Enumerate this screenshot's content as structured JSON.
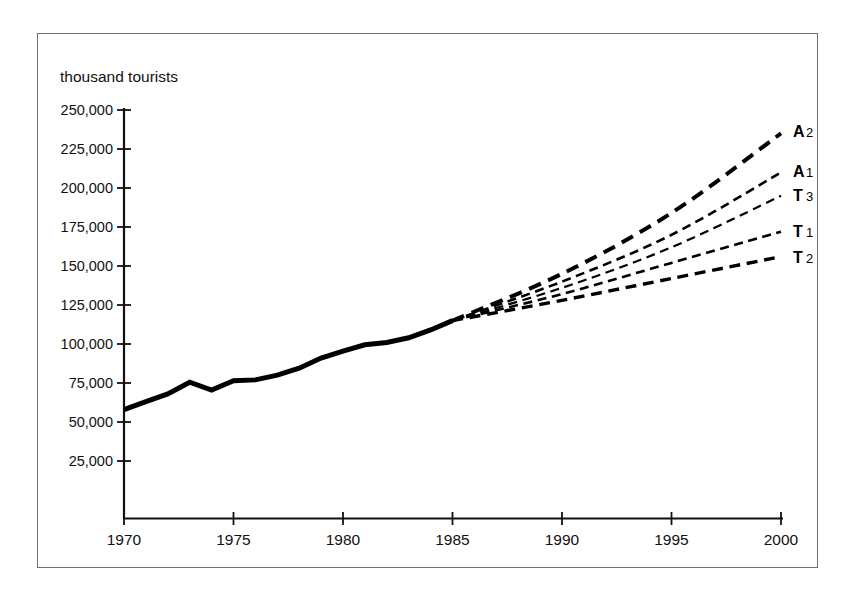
{
  "figure": {
    "axis_title": "thousand tourists",
    "border_color": "#6f6f6f"
  },
  "chart_data": {
    "type": "line",
    "title": "",
    "subtitle": "",
    "xlabel": "",
    "ylabel": "thousand tourists",
    "xlim": [
      1970,
      2000
    ],
    "ylim": [
      0,
      250000
    ],
    "xticks": [
      1970,
      1975,
      1980,
      1985,
      1990,
      1995,
      2000
    ],
    "xtick_labels": [
      "1970",
      "1975",
      "1980",
      "1985",
      "1990",
      "1995",
      "2000"
    ],
    "yticks": [
      25000,
      50000,
      75000,
      100000,
      125000,
      150000,
      175000,
      200000,
      225000,
      250000
    ],
    "ytick_labels": [
      "25,000",
      "50,000",
      "75,000",
      "100,000",
      "125,000",
      "150,000",
      "175,000",
      "200,000",
      "225,000",
      "250,000"
    ],
    "grid": false,
    "legend_position": "right-inline-end-labels",
    "branch_year": 1985,
    "branch_value": 115000,
    "series": [
      {
        "name": "Historical",
        "label": "",
        "style": "solid",
        "linewidth": 5,
        "color": "#000000",
        "x": [
          1970,
          1971,
          1972,
          1973,
          1974,
          1975,
          1976,
          1977,
          1978,
          1979,
          1980,
          1981,
          1982,
          1983,
          1984,
          1985
        ],
        "values": [
          58000,
          63000,
          68000,
          75500,
          70500,
          76500,
          77000,
          80000,
          84500,
          91000,
          95500,
          99500,
          101000,
          104000,
          109000,
          115000
        ]
      },
      {
        "name": "A2",
        "label": "A2",
        "label_letter": "A",
        "label_digit": "2",
        "style": "dashed",
        "linewidth": 4,
        "color": "#000000",
        "x": [
          1985,
          1990,
          1995,
          2000
        ],
        "values": [
          115000,
          145000,
          184000,
          235000
        ]
      },
      {
        "name": "A1",
        "label": "A1",
        "label_letter": "A",
        "label_digit": "1",
        "style": "dashed",
        "linewidth": 2.6,
        "color": "#000000",
        "x": [
          1985,
          1990,
          1995,
          2000
        ],
        "values": [
          115000,
          140000,
          170000,
          210000
        ]
      },
      {
        "name": "T3",
        "label": "T3",
        "label_letter": "T",
        "label_digit": "3",
        "style": "dashed",
        "linewidth": 2.2,
        "color": "#000000",
        "x": [
          1985,
          1990,
          1995,
          2000
        ],
        "values": [
          115000,
          136000,
          162000,
          195000
        ]
      },
      {
        "name": "T1",
        "label": "T1",
        "label_letter": "T",
        "label_digit": "1",
        "style": "dashed",
        "linewidth": 2.6,
        "color": "#000000",
        "x": [
          1985,
          1990,
          1995,
          2000
        ],
        "values": [
          115000,
          132000,
          152000,
          172000
        ]
      },
      {
        "name": "T2",
        "label": "T2",
        "label_letter": "T",
        "label_digit": "2",
        "style": "dashed",
        "linewidth": 3.4,
        "color": "#000000",
        "x": [
          1985,
          1990,
          1995,
          2000
        ],
        "values": [
          115000,
          128000,
          142000,
          156000
        ]
      }
    ]
  }
}
